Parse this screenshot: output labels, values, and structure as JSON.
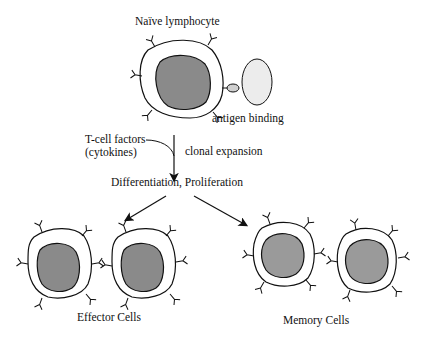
{
  "diagram": {
    "title_label": "Naïve lymphocyte",
    "antigen_label": "antigen binding",
    "factors_label_line1": "T-cell factors",
    "factors_label_line2": "(cytokines)",
    "expansion_label": "clonal expansion",
    "process_label": "Differentiation, Proliferation",
    "effector_label": "Effector Cells",
    "memory_label": "Memory Cells",
    "colors": {
      "nucleus_dark": "#8a8a8a",
      "nucleus_memory": "#9a9a9a",
      "antigen_fill": "#ececec",
      "outline": "#111111",
      "background": "#ffffff"
    }
  }
}
